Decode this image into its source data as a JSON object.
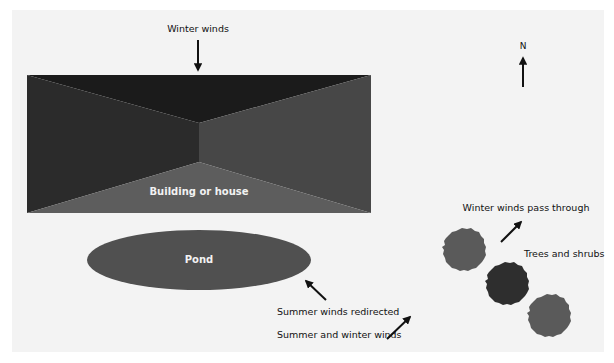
{
  "diagram": {
    "labels": {
      "winter_winds": "Winter winds",
      "north": "N",
      "building": "Building or house",
      "pond": "Pond",
      "winter_pass": "Winter winds pass through",
      "trees": "Trees and shrubs",
      "summer_redirected": "Summer winds redirected",
      "summer_winter": "Summer and winter winds"
    },
    "colors": {
      "background": "#f3f3f3",
      "building_top": "#1b1b1b",
      "building_left": "#2b2b2b",
      "building_right": "#474747",
      "building_bottom": "#5d5d5d",
      "pond": "#505050",
      "tree_light": "#5a5a5a",
      "tree_dark": "#2e2e2e",
      "arrow": "#111111"
    }
  }
}
